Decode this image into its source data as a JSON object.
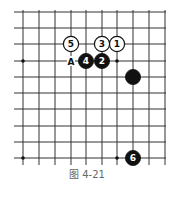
{
  "diagram": {
    "caption": "图 4-21",
    "grid": {
      "x_lines": [
        23,
        39,
        55,
        71,
        86,
        102,
        117,
        133,
        149,
        165
      ],
      "y_lines": [
        12,
        28,
        44,
        61,
        77,
        93,
        109,
        126,
        142,
        158
      ],
      "line_color": "#333333"
    },
    "star_points": [
      [
        23,
        61
      ],
      [
        117,
        61
      ],
      [
        23,
        158
      ],
      [
        117,
        158
      ]
    ],
    "stones": [
      {
        "color": "white",
        "label": "1",
        "x": 117,
        "y": 44
      },
      {
        "color": "black",
        "label": "2",
        "x": 102,
        "y": 61
      },
      {
        "color": "white",
        "label": "3",
        "x": 102,
        "y": 44
      },
      {
        "color": "black",
        "label": "4",
        "x": 86,
        "y": 61
      },
      {
        "color": "white",
        "label": "5",
        "x": 71,
        "y": 44
      },
      {
        "color": "black",
        "label": "6",
        "x": 133,
        "y": 158
      },
      {
        "color": "black",
        "label": "",
        "x": 133,
        "y": 77
      }
    ],
    "markers": [
      {
        "label": "A",
        "x": 71,
        "y": 61
      }
    ]
  }
}
